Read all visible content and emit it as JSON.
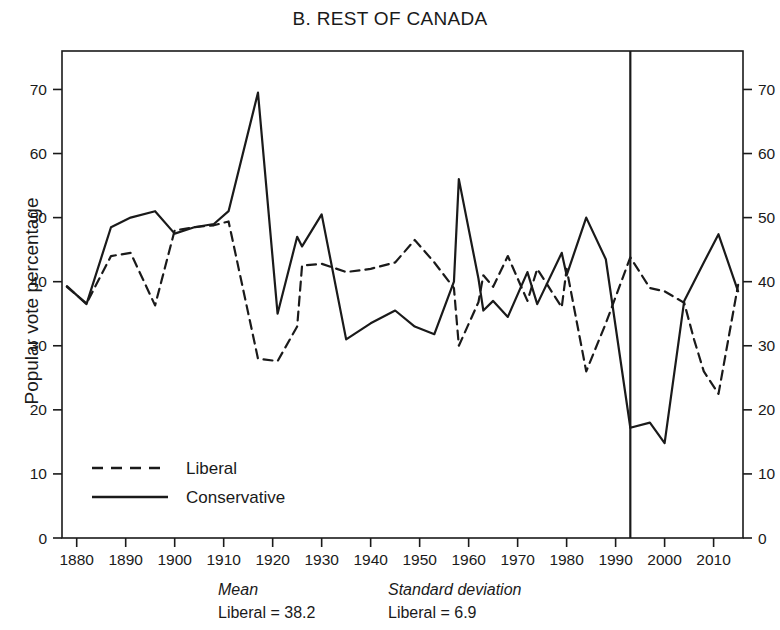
{
  "chart_data": {
    "type": "line",
    "title": "B. REST OF CANADA",
    "xlabel": "",
    "ylabel": "Popular vote percentage",
    "xlim": [
      1877,
      2016
    ],
    "ylim": [
      0,
      76
    ],
    "yticks": [
      0,
      10,
      20,
      30,
      40,
      50,
      60,
      70
    ],
    "xticks": [
      1880,
      1890,
      1900,
      1910,
      1920,
      1930,
      1940,
      1950,
      1960,
      1970,
      1980,
      1990,
      2000,
      2010
    ],
    "grid": false,
    "legend_position": "lower-left-inside",
    "annotations": [
      {
        "type": "vline",
        "x": 1993,
        "label": ""
      }
    ],
    "series": [
      {
        "name": "Liberal",
        "style": "dashed",
        "color": "#1a1a1a",
        "x": [
          1878,
          1882,
          1887,
          1891,
          1896,
          1900,
          1904,
          1908,
          1911,
          1917,
          1921,
          1925,
          1926,
          1930,
          1935,
          1940,
          1945,
          1949,
          1953,
          1957,
          1958,
          1962,
          1963,
          1965,
          1968,
          1972,
          1974,
          1979,
          1980,
          1984,
          1988,
          1993,
          1997,
          2000,
          2004,
          2006,
          2008,
          2011,
          2015
        ],
        "values": [
          39.2,
          36.6,
          44.0,
          44.5,
          36.3,
          48.0,
          48.5,
          48.8,
          49.4,
          28.0,
          27.6,
          33.0,
          42.5,
          42.8,
          41.5,
          42.0,
          43.0,
          46.5,
          43.0,
          39.0,
          30.0,
          36.8,
          41.0,
          39.2,
          44.0,
          37.0,
          42.0,
          36.0,
          42.0,
          26.0,
          33.5,
          43.8,
          39.0,
          38.5,
          36.7,
          31.0,
          26.0,
          22.5,
          39.5
        ]
      },
      {
        "name": "Conservative",
        "style": "solid",
        "color": "#1a1a1a",
        "x": [
          1878,
          1882,
          1887,
          1891,
          1896,
          1900,
          1904,
          1908,
          1911,
          1917,
          1921,
          1925,
          1926,
          1930,
          1935,
          1940,
          1945,
          1949,
          1953,
          1957,
          1958,
          1962,
          1963,
          1965,
          1968,
          1972,
          1974,
          1979,
          1980,
          1984,
          1988,
          1993,
          1997,
          2000,
          2004,
          2006,
          2008,
          2011,
          2015
        ],
        "values": [
          39.3,
          36.5,
          48.5,
          50.0,
          51.0,
          47.5,
          48.5,
          49.0,
          51.0,
          69.5,
          35.0,
          47.0,
          45.5,
          50.5,
          31.0,
          33.5,
          35.5,
          33.0,
          31.8,
          40.0,
          56.0,
          40.5,
          35.5,
          37.0,
          34.5,
          41.5,
          36.5,
          44.5,
          41.0,
          50.0,
          43.5,
          17.2,
          18.0,
          14.8,
          37.0,
          40.0,
          43.0,
          47.4,
          38.5
        ]
      }
    ],
    "stats": {
      "mean": {
        "header": "Mean",
        "liberal": "Liberal = 38.2"
      },
      "standard_deviation": {
        "header": "Standard deviation",
        "liberal": "Liberal = 6.9"
      }
    }
  },
  "legend": {
    "items": [
      {
        "label": "Liberal",
        "style": "dashed"
      },
      {
        "label": "Conservative",
        "style": "solid"
      }
    ]
  }
}
